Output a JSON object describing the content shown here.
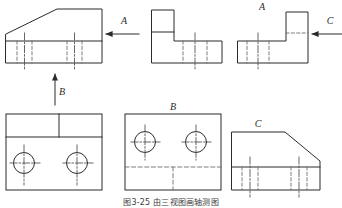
{
  "figure": {
    "caption": "图3-25  由三视图画轴测图",
    "line_color": "#2b2b2b",
    "hidden_color": "#6e6e6e",
    "center_color": "#555555",
    "background": "#ffffff"
  },
  "arrows": [
    {
      "id": "arrow-a",
      "label": "A",
      "direction": "left",
      "label_x": 124,
      "label_y": 24
    },
    {
      "id": "arrow-b",
      "label": "B",
      "direction": "up",
      "label_x": 62,
      "label_y": 93
    },
    {
      "id": "arrow-c",
      "label": "C",
      "direction": "left",
      "label_x": 330,
      "label_y": 24
    }
  ],
  "views": [
    {
      "id": "view-front-top-left",
      "name": "front-view",
      "label": "",
      "position": "top-left",
      "description": "Front view with chamfered upper-left corner, base band with hidden lines"
    },
    {
      "id": "view-l-shape-top-middle",
      "name": "left-side-view",
      "label": "",
      "position": "top-middle",
      "description": "L-shaped profile with hidden lines in the lower flange"
    },
    {
      "id": "view-a-top-right",
      "name": "view-a",
      "label": "A",
      "position": "top-right",
      "description": "Mirrored L-shaped profile viewed along arrow A"
    },
    {
      "id": "view-top-bottom-left",
      "name": "top-view",
      "label": "",
      "position": "bottom-left",
      "description": "Top view with two bored holes and a divided upper band"
    },
    {
      "id": "view-b-bottom-middle",
      "name": "view-b",
      "label": "B",
      "position": "bottom-middle",
      "description": "View along arrow B showing two holes and hidden edge lines"
    },
    {
      "id": "view-c-bottom-right",
      "name": "view-c",
      "label": "C",
      "position": "bottom-right",
      "description": "View along arrow C with right-sloping chamfer and base band"
    }
  ],
  "view_labels": {
    "a": "A",
    "b": "B",
    "c": "C"
  }
}
